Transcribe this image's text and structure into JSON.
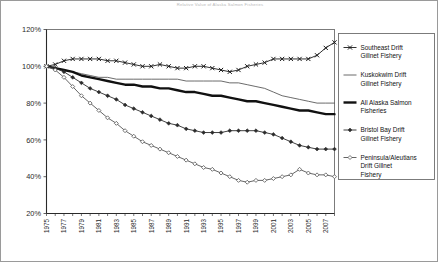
{
  "figure": {
    "title": "Relative Value of Alaska Salmon Fisheries",
    "border_color": "#9a9a9a",
    "background": "#ffffff"
  },
  "axes": {
    "y_ticks": [
      "20%",
      "40%",
      "60%",
      "80%",
      "100%",
      "120%"
    ],
    "y_min": 20,
    "y_max": 120,
    "x_ticks": [
      "1975",
      "1977",
      "1979",
      "1981",
      "1983",
      "1985",
      "1987",
      "1989",
      "1991",
      "1993",
      "1995",
      "1997",
      "1999",
      "2001",
      "2003",
      "2005",
      "2007"
    ],
    "x_min": 1975,
    "x_max": 2008
  },
  "legend": {
    "position": "right",
    "items": [
      {
        "label": "Southeast Drift Gillnet Fishery",
        "marker": "cross",
        "color": "#1a1a1a",
        "width": 0.9
      },
      {
        "label": "Kuskokwim Drift Gillnet Fishery",
        "marker": "none",
        "color": "#5a5a5a",
        "width": 0.9
      },
      {
        "label": "All Alaska Salmon Fisheries",
        "marker": "none",
        "color": "#111111",
        "width": 2.4
      },
      {
        "label": "Bristol Bay Drift Gillnet Fishery",
        "marker": "diamond-filled",
        "color": "#2b2b2b",
        "width": 0.9
      },
      {
        "label": "Peninsula/Aleutians Drift Gillnet Fishery",
        "marker": "diamond-open",
        "color": "#555555",
        "width": 0.9
      }
    ]
  },
  "chart_data": {
    "type": "line",
    "title": "Relative Value of Alaska Salmon Fisheries",
    "xlabel": "",
    "ylabel": "",
    "ylim": [
      20,
      120
    ],
    "xlim": [
      1975,
      2008
    ],
    "grid": false,
    "legend_position": "right",
    "x": [
      1975,
      1976,
      1977,
      1978,
      1979,
      1980,
      1981,
      1982,
      1983,
      1984,
      1985,
      1986,
      1987,
      1988,
      1989,
      1990,
      1991,
      1992,
      1993,
      1994,
      1995,
      1996,
      1997,
      1998,
      1999,
      2000,
      2001,
      2002,
      2003,
      2004,
      2005,
      2006,
      2007,
      2008
    ],
    "series": [
      {
        "name": "Southeast Drift Gillnet Fishery",
        "marker": "cross",
        "values": [
          100,
          101,
          103,
          104,
          104,
          104,
          104,
          103,
          103,
          102,
          101,
          100,
          100,
          101,
          100,
          99,
          99,
          100,
          100,
          99,
          98,
          97,
          98,
          100,
          101,
          102,
          104,
          104,
          104,
          104,
          104,
          106,
          110,
          113
        ]
      },
      {
        "name": "Kuskokwim Drift Gillnet Fishery",
        "marker": "none",
        "values": [
          100,
          99,
          98,
          97,
          96,
          95,
          94,
          94,
          93,
          93,
          93,
          93,
          93,
          93,
          93,
          93,
          92,
          92,
          92,
          92,
          92,
          91,
          91,
          90,
          89,
          88,
          86,
          84,
          83,
          82,
          81,
          80,
          80,
          80
        ]
      },
      {
        "name": "All Alaska Salmon Fisheries",
        "marker": "none",
        "values": [
          100,
          99,
          98,
          97,
          95,
          94,
          93,
          92,
          91,
          90,
          90,
          89,
          89,
          88,
          88,
          87,
          86,
          86,
          85,
          84,
          84,
          83,
          82,
          81,
          81,
          80,
          79,
          78,
          77,
          76,
          76,
          75,
          74,
          74
        ]
      },
      {
        "name": "Bristol Bay Drift Gillnet Fishery",
        "marker": "diamond-filled",
        "values": [
          100,
          99,
          97,
          94,
          91,
          88,
          86,
          84,
          82,
          79,
          77,
          75,
          73,
          71,
          69,
          68,
          66,
          65,
          64,
          64,
          64,
          65,
          65,
          65,
          65,
          64,
          63,
          61,
          59,
          57,
          56,
          55,
          55,
          55
        ]
      },
      {
        "name": "Peninsula/Aleutians Drift Gillnet Fishery",
        "marker": "diamond-open",
        "values": [
          100,
          98,
          94,
          89,
          84,
          80,
          76,
          72,
          69,
          65,
          62,
          59,
          57,
          55,
          53,
          51,
          49,
          47,
          45,
          44,
          42,
          40,
          38,
          37,
          38,
          38,
          39,
          40,
          41,
          44,
          42,
          41,
          41,
          40
        ]
      }
    ]
  }
}
